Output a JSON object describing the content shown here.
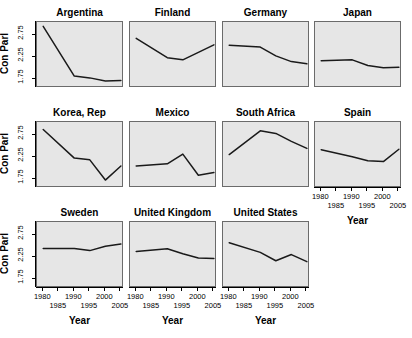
{
  "figure": {
    "ylabel": "Con Parl",
    "xlabel": "Year",
    "panel_bg": "#e6e6e6",
    "line_color": "#1a1a1a",
    "border_color": "#6b6b6b"
  },
  "axes": {
    "y_ticks": [
      "1.75",
      "2.25",
      "2.75"
    ],
    "y_tick_values": [
      1.75,
      2.25,
      2.75
    ],
    "ylim": [
      1.55,
      3.05
    ],
    "x_ticks": [
      "1980",
      "1985",
      "1990",
      "1995",
      "2000",
      "2005"
    ],
    "x_tick_values": [
      1980,
      1985,
      1990,
      1995,
      2000,
      2005
    ],
    "xlim": [
      1978,
      2006
    ]
  },
  "chart_data": {
    "type": "line",
    "title": "",
    "subtitle": "",
    "xlabel": "Year",
    "ylabel": "Con Parl",
    "xlim": [
      1978,
      2006
    ],
    "ylim": [
      1.55,
      3.05
    ],
    "grid": false,
    "legend": "none",
    "layout": {
      "rows": 3,
      "cols": 4,
      "panels_per_row": [
        4,
        4,
        3
      ]
    },
    "panels": [
      {
        "name": "Argentina",
        "row": 1,
        "col": 1,
        "x": [
          1980,
          1990,
          1995,
          2000,
          2005
        ],
        "y": [
          2.95,
          1.82,
          1.78,
          1.71,
          1.72
        ]
      },
      {
        "name": "Finland",
        "row": 1,
        "col": 2,
        "x": [
          1980,
          1990,
          1995,
          2000,
          2005
        ],
        "y": [
          2.68,
          2.24,
          2.19,
          2.36,
          2.53
        ]
      },
      {
        "name": "Germany",
        "row": 1,
        "col": 3,
        "x": [
          1980,
          1990,
          1995,
          2000,
          2005
        ],
        "y": [
          2.52,
          2.48,
          2.28,
          2.15,
          2.1
        ]
      },
      {
        "name": "Japan",
        "row": 1,
        "col": 4,
        "x": [
          1980,
          1990,
          1995,
          2000,
          2005
        ],
        "y": [
          2.17,
          2.19,
          2.06,
          2.01,
          2.02
        ]
      },
      {
        "name": "Korea, Rep",
        "row": 2,
        "col": 1,
        "x": [
          1980,
          1990,
          1995,
          2000,
          2005
        ],
        "y": [
          2.88,
          2.23,
          2.19,
          1.73,
          2.05
        ]
      },
      {
        "name": "Mexico",
        "row": 2,
        "col": 2,
        "x": [
          1980,
          1990,
          1995,
          2000,
          2005
        ],
        "y": [
          2.05,
          2.1,
          2.32,
          1.84,
          1.9
        ]
      },
      {
        "name": "South Africa",
        "row": 2,
        "col": 3,
        "x": [
          1980,
          1990,
          1995,
          2000,
          2005
        ],
        "y": [
          2.31,
          2.85,
          2.79,
          2.61,
          2.45
        ]
      },
      {
        "name": "Spain",
        "row": 2,
        "col": 4,
        "x": [
          1980,
          1990,
          1995,
          2000,
          2005
        ],
        "y": [
          2.42,
          2.26,
          2.17,
          2.15,
          2.43
        ]
      },
      {
        "name": "Sweden",
        "row": 3,
        "col": 1,
        "x": [
          1980,
          1990,
          1995,
          2000,
          2005
        ],
        "y": [
          2.45,
          2.45,
          2.4,
          2.5,
          2.55
        ]
      },
      {
        "name": "United Kingdom",
        "row": 3,
        "col": 2,
        "x": [
          1980,
          1990,
          1995,
          2000,
          2005
        ],
        "y": [
          2.38,
          2.44,
          2.33,
          2.23,
          2.22
        ]
      },
      {
        "name": "United States",
        "row": 3,
        "col": 3,
        "x": [
          1980,
          1990,
          1995,
          2000,
          2005
        ],
        "y": [
          2.58,
          2.36,
          2.17,
          2.31,
          2.15
        ]
      }
    ]
  }
}
